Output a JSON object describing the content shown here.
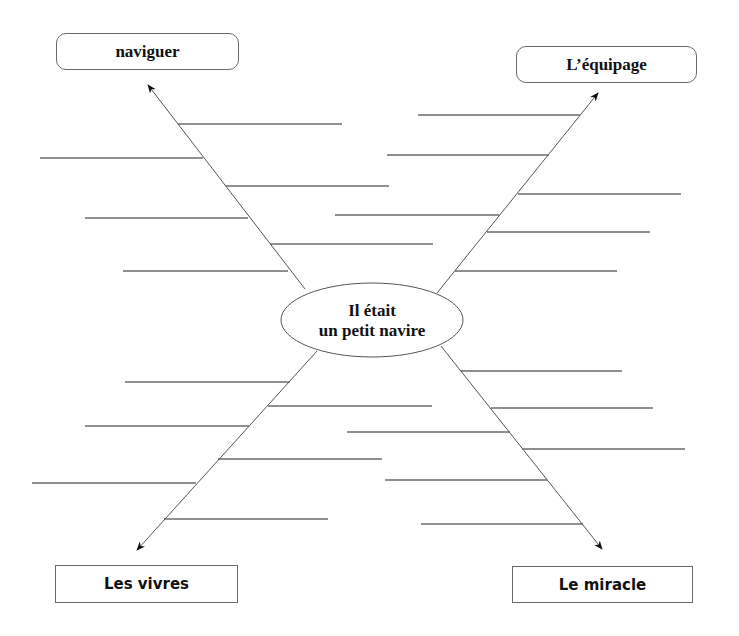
{
  "diagram": {
    "type": "mind-map",
    "center": {
      "line1": "Il était",
      "line2": "un petit navire"
    },
    "branches": [
      {
        "id": "top-left",
        "label": "naviguer",
        "box": {
          "x": 56,
          "y": 33,
          "w": 183,
          "h": 37,
          "style": "rounded"
        },
        "arrow": {
          "x1": 305,
          "y1": 289,
          "x2": 148,
          "y2": 85
        },
        "lines": [
          {
            "y": 124,
            "x1": 178,
            "x2": 342
          },
          {
            "y": 158,
            "x1": 40,
            "x2": 203
          },
          {
            "y": 186,
            "x1": 226,
            "x2": 389
          },
          {
            "y": 218,
            "x1": 85,
            "x2": 248
          },
          {
            "y": 244,
            "x1": 270,
            "x2": 433
          },
          {
            "y": 271,
            "x1": 123,
            "x2": 288
          }
        ]
      },
      {
        "id": "top-right",
        "label": "L’équipage",
        "box": {
          "x": 516,
          "y": 46,
          "w": 181,
          "h": 37,
          "style": "rounded"
        },
        "arrow": {
          "x1": 437,
          "y1": 293,
          "x2": 598,
          "y2": 93
        },
        "lines": [
          {
            "y": 115,
            "x1": 418,
            "x2": 580
          },
          {
            "y": 155,
            "x1": 387,
            "x2": 549
          },
          {
            "y": 194,
            "x1": 518,
            "x2": 681
          },
          {
            "y": 215,
            "x1": 335,
            "x2": 499
          },
          {
            "y": 232,
            "x1": 487,
            "x2": 650
          },
          {
            "y": 271,
            "x1": 455,
            "x2": 617
          }
        ]
      },
      {
        "id": "bottom-left",
        "label": "Les vivres",
        "box": {
          "x": 55,
          "y": 565,
          "w": 183,
          "h": 38,
          "style": "square"
        },
        "arrow": {
          "x1": 317,
          "y1": 351,
          "x2": 137,
          "y2": 550
        },
        "lines": [
          {
            "y": 382,
            "x1": 125,
            "x2": 290
          },
          {
            "y": 406,
            "x1": 268,
            "x2": 432
          },
          {
            "y": 426,
            "x1": 85,
            "x2": 249
          },
          {
            "y": 459,
            "x1": 218,
            "x2": 382
          },
          {
            "y": 483,
            "x1": 32,
            "x2": 196
          },
          {
            "y": 519,
            "x1": 164,
            "x2": 328
          }
        ]
      },
      {
        "id": "bottom-right",
        "label": "Le miracle",
        "box": {
          "x": 512,
          "y": 566,
          "w": 181,
          "h": 37,
          "style": "square"
        },
        "arrow": {
          "x1": 441,
          "y1": 346,
          "x2": 602,
          "y2": 549
        },
        "lines": [
          {
            "y": 371,
            "x1": 461,
            "x2": 622
          },
          {
            "y": 408,
            "x1": 491,
            "x2": 653
          },
          {
            "y": 432,
            "x1": 347,
            "x2": 510
          },
          {
            "y": 449,
            "x1": 522,
            "x2": 685
          },
          {
            "y": 480,
            "x1": 385,
            "x2": 547
          },
          {
            "y": 524,
            "x1": 421,
            "x2": 583
          }
        ]
      }
    ],
    "ellipse": {
      "cx": 372,
      "cy": 320,
      "rx": 91,
      "ry": 37
    },
    "colors": {
      "stroke": "#222222",
      "arrow_stroke": "#555555",
      "box_border": "#6a6a6a",
      "text": "#111111"
    }
  }
}
